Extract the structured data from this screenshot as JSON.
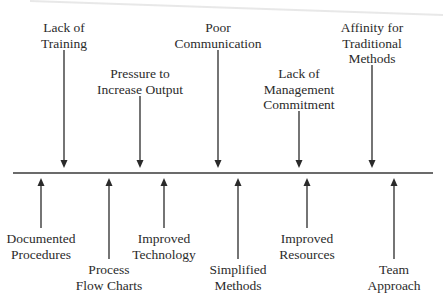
{
  "diagram": {
    "type": "force-field-analysis",
    "axis": {
      "y": 173,
      "x_start": 13,
      "x_end": 433,
      "color": "#3a3a3a"
    },
    "restraining_forces": [
      {
        "id": "lack-of-training",
        "lines": [
          "Lack of",
          "Training"
        ],
        "x": 64,
        "label_top": 20,
        "arrow_top": 50,
        "arrow_bottom": 168
      },
      {
        "id": "pressure-to-increase-output",
        "lines": [
          "Pressure to",
          "Increase Output"
        ],
        "x": 140,
        "label_top": 66,
        "arrow_top": 96,
        "arrow_bottom": 168
      },
      {
        "id": "poor-communication",
        "lines": [
          "Poor",
          "Communication"
        ],
        "x": 218,
        "label_top": 20,
        "arrow_top": 50,
        "arrow_bottom": 168
      },
      {
        "id": "lack-of-management-commitment",
        "lines": [
          "Lack of",
          "Management",
          "Commitment"
        ],
        "x": 299,
        "label_top": 66,
        "arrow_top": 111,
        "arrow_bottom": 168
      },
      {
        "id": "affinity-for-traditional-methods",
        "lines": [
          "Affinity for",
          "Traditional",
          "Methods"
        ],
        "x": 372,
        "label_top": 20,
        "arrow_top": 65,
        "arrow_bottom": 168
      }
    ],
    "driving_forces": [
      {
        "id": "documented-procedures",
        "lines": [
          "Documented",
          "Procedures"
        ],
        "x": 41,
        "label_top": 231,
        "arrow_top": 178,
        "arrow_bottom": 228
      },
      {
        "id": "process-flow-charts",
        "lines": [
          "Process",
          "Flow Charts"
        ],
        "x": 109,
        "label_top": 262,
        "arrow_top": 178,
        "arrow_bottom": 259
      },
      {
        "id": "improved-technology",
        "lines": [
          "Improved",
          "Technology"
        ],
        "x": 164,
        "label_top": 231,
        "arrow_top": 178,
        "arrow_bottom": 228
      },
      {
        "id": "simplified-methods",
        "lines": [
          "Simplified",
          "Methods"
        ],
        "x": 238,
        "label_top": 262,
        "arrow_top": 178,
        "arrow_bottom": 259
      },
      {
        "id": "improved-resources",
        "lines": [
          "Improved",
          "Resources"
        ],
        "x": 307,
        "label_top": 231,
        "arrow_top": 178,
        "arrow_bottom": 228
      },
      {
        "id": "team-approach",
        "lines": [
          "Team",
          "Approach"
        ],
        "x": 394,
        "label_top": 262,
        "arrow_top": 178,
        "arrow_bottom": 259
      }
    ]
  }
}
